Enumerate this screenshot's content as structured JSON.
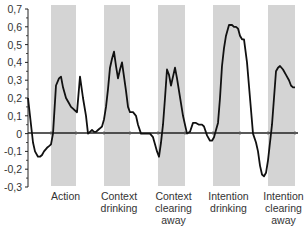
{
  "chart_data": {
    "type": "line",
    "title": "",
    "xlabel": "",
    "ylabel": "",
    "ylim": [
      -0.3,
      0.7
    ],
    "yticks": [
      0.7,
      0.6,
      0.5,
      0.4,
      0.3,
      0.2,
      0.1,
      0,
      -0.1,
      -0.2,
      -0.3
    ],
    "ytick_labels": [
      "0,7",
      "0,6",
      "0,5",
      "0,4",
      "0,3",
      "0,2",
      "0,1",
      "0",
      "-0,1",
      "-0,2",
      "-0,3"
    ],
    "grid": false,
    "legend": null,
    "shaded_periods": [
      {
        "label_lines": [
          "Action"
        ],
        "x_start": 51,
        "x_end": 76
      },
      {
        "label_lines": [
          "Context",
          "drinking"
        ],
        "x_start": 104,
        "x_end": 130
      },
      {
        "label_lines": [
          "Context",
          "clearing",
          "away"
        ],
        "x_start": 158,
        "x_end": 185
      },
      {
        "label_lines": [
          "Intention",
          "drinking"
        ],
        "x_start": 213,
        "x_end": 240
      },
      {
        "label_lines": [
          "Intention",
          "clearing",
          "away"
        ],
        "x_start": 268,
        "x_end": 295
      }
    ],
    "series": [
      {
        "name": "response",
        "color": "#111111",
        "x": [
          28,
          30,
          33,
          35,
          38,
          40,
          42,
          44,
          47,
          49,
          51,
          53,
          56,
          59,
          61,
          63,
          66,
          69,
          71,
          73,
          75,
          77,
          80,
          83,
          86,
          88,
          90,
          92,
          94,
          96,
          98,
          100,
          102,
          104,
          106,
          108,
          110,
          112,
          114,
          116,
          118,
          120,
          122,
          124,
          126,
          128,
          130,
          133,
          136,
          138,
          141,
          144,
          147,
          150,
          153,
          155,
          157,
          159,
          161,
          163,
          165,
          167,
          169,
          171,
          173,
          175,
          177,
          179,
          181,
          183,
          185,
          187,
          190,
          193,
          196,
          199,
          202,
          204,
          207,
          210,
          212,
          214,
          216,
          218,
          220,
          222,
          224,
          226,
          229,
          232,
          234,
          236,
          238,
          240,
          242,
          244,
          247,
          250,
          253,
          256,
          258,
          260,
          262,
          264,
          266,
          268,
          270,
          272,
          274,
          276,
          278,
          280,
          283,
          286,
          289,
          291,
          293,
          295
        ],
        "values": [
          0.2,
          0.1,
          -0.05,
          -0.1,
          -0.13,
          -0.13,
          -0.12,
          -0.1,
          -0.08,
          -0.07,
          -0.06,
          0.0,
          0.27,
          0.31,
          0.32,
          0.26,
          0.2,
          0.17,
          0.15,
          0.14,
          0.13,
          0.12,
          0.32,
          0.2,
          0.1,
          0.0,
          0.01,
          0.02,
          0.01,
          0.01,
          0.02,
          0.03,
          0.04,
          0.08,
          0.15,
          0.25,
          0.37,
          0.42,
          0.46,
          0.38,
          0.31,
          0.36,
          0.4,
          0.32,
          0.24,
          0.15,
          0.12,
          0.12,
          0.1,
          0.05,
          0.0,
          0.0,
          0.0,
          0.0,
          -0.02,
          -0.06,
          -0.1,
          -0.13,
          -0.05,
          0.05,
          0.2,
          0.36,
          0.33,
          0.27,
          0.32,
          0.37,
          0.31,
          0.24,
          0.17,
          0.1,
          0.05,
          0.0,
          0.01,
          0.06,
          0.06,
          0.05,
          0.05,
          0.04,
          -0.01,
          -0.04,
          -0.04,
          -0.02,
          0.02,
          0.06,
          0.2,
          0.38,
          0.48,
          0.55,
          0.61,
          0.61,
          0.6,
          0.6,
          0.59,
          0.55,
          0.53,
          0.53,
          0.4,
          0.2,
          0.0,
          -0.05,
          -0.1,
          -0.18,
          -0.23,
          -0.24,
          -0.22,
          -0.15,
          -0.05,
          0.05,
          0.2,
          0.35,
          0.37,
          0.38,
          0.36,
          0.33,
          0.3,
          0.27,
          0.26,
          0.26
        ]
      }
    ],
    "categories": [
      "Action",
      "Context drinking",
      "Context clearing away",
      "Intention drinking",
      "Intention clearing away"
    ]
  },
  "colors": {
    "band_fill": "#d4d4d4",
    "line": "#111111",
    "axis": "#222222"
  },
  "layout": {
    "axis_x": 28,
    "plot_right": 298,
    "y_top_px": 9,
    "y_zero_px": 133,
    "y_bottom_px": 187,
    "band_top_px": 5,
    "band_bottom_px": 186
  }
}
